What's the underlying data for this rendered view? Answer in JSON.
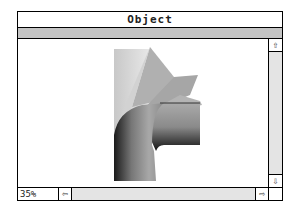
{
  "window": {
    "title": "Object"
  },
  "content": {
    "image": "3d-rendered-pipe-elbow"
  },
  "scrollbars": {
    "vertical": {
      "up_icon": "⇧",
      "down_icon": "⇩"
    },
    "horizontal": {
      "left_icon": "⇦",
      "right_icon": "⇨"
    }
  },
  "status": {
    "zoom_level": "35%"
  },
  "colors": {
    "toolbar_gray": "#c4c4c4",
    "scroll_track": "#e4e4e4"
  }
}
